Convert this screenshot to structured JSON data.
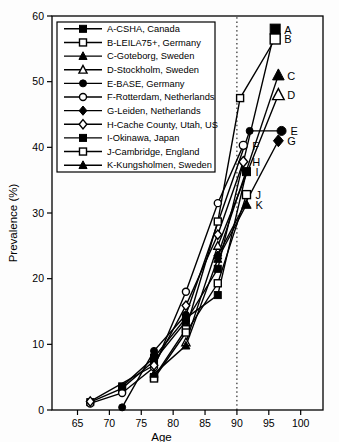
{
  "figure": {
    "x_axis_label": "Age",
    "y_axis_label": "Prevalence (%)",
    "ink_color": "#000000",
    "background_color": "#fdfdfd"
  },
  "chart_data": {
    "type": "line",
    "title": "",
    "xlabel": "Age",
    "ylabel": "Prevalence (%)",
    "xlim": [
      61,
      103.5
    ],
    "ylim": [
      0,
      60
    ],
    "x_ticks": [
      65,
      70,
      75,
      80,
      85,
      90,
      95,
      100
    ],
    "y_ticks": [
      0,
      10,
      20,
      30,
      40,
      50,
      60
    ],
    "grid": false,
    "reference_line": {
      "axis": "x",
      "value": 90,
      "style": "dotted"
    },
    "legend_position": "top-left-inside",
    "series": [
      {
        "key": "A",
        "label": "A-CSHA, Canada",
        "marker": "square",
        "fill": "filled",
        "end_label": "A",
        "end_marker_size": 10,
        "points": [
          [
            67,
            1.2
          ],
          [
            72,
            3.3
          ],
          [
            77,
            7.5
          ],
          [
            82,
            13.5
          ],
          [
            87,
            21.5
          ],
          [
            96,
            58
          ]
        ]
      },
      {
        "key": "B",
        "label": "B-LEILA75+, Germany",
        "marker": "square",
        "fill": "open",
        "end_label": "B",
        "end_marker_size": 10,
        "points": [
          [
            77,
            5.0
          ],
          [
            82,
            12.3
          ],
          [
            87,
            28.7
          ],
          [
            90.5,
            47.5
          ],
          [
            96,
            56.5
          ]
        ]
      },
      {
        "key": "C",
        "label": "C-Goteborg, Sweden",
        "marker": "triangle",
        "fill": "filled",
        "end_label": "C",
        "end_marker_size": 10,
        "points": [
          [
            87,
            23.5
          ],
          [
            96.5,
            51
          ]
        ]
      },
      {
        "key": "D",
        "label": "D-Stockholm, Sweden",
        "marker": "triangle",
        "fill": "open",
        "end_label": "D",
        "end_marker_size": 10,
        "points": [
          [
            82,
            10.3
          ],
          [
            87,
            25
          ],
          [
            96.5,
            48
          ]
        ]
      },
      {
        "key": "E",
        "label": "E-BASE, Germany",
        "marker": "circle",
        "fill": "filled",
        "end_label": "E",
        "end_marker_size": 9,
        "points": [
          [
            72,
            0.4
          ],
          [
            77,
            9
          ],
          [
            82,
            14.5
          ],
          [
            92,
            42.5
          ],
          [
            97,
            42.5
          ]
        ]
      },
      {
        "key": "F",
        "label": "F-Rotterdam, Netherlands",
        "marker": "circle",
        "fill": "open",
        "end_label": "F",
        "end_marker_size": 8,
        "points": [
          [
            67,
            1.0
          ],
          [
            72,
            2.6
          ],
          [
            77,
            6.5
          ],
          [
            82,
            18
          ],
          [
            87,
            31.5
          ],
          [
            91,
            40.3
          ]
        ]
      },
      {
        "key": "G",
        "label": "G-Leiden, Netherlands",
        "marker": "diamond",
        "fill": "filled",
        "end_label": "G",
        "end_marker_size": 9,
        "points": [
          [
            87,
            23.5
          ],
          [
            96.5,
            41
          ]
        ]
      },
      {
        "key": "H",
        "label": "H-Cache County, Utah, US",
        "marker": "diamond",
        "fill": "open",
        "end_label": "H",
        "end_marker_size": 8,
        "points": [
          [
            67,
            1.3
          ],
          [
            77,
            6.8
          ],
          [
            82,
            15.9
          ],
          [
            87,
            26.7
          ],
          [
            91,
            37.8
          ]
        ]
      },
      {
        "key": "I",
        "label": "I-Okinawa, Japan",
        "marker": "square",
        "fill": "filled",
        "end_label": "I",
        "end_marker_size": 8,
        "points": [
          [
            72,
            3.6
          ],
          [
            77,
            8
          ],
          [
            82,
            14
          ],
          [
            87,
            17.5
          ],
          [
            91.5,
            36.3
          ]
        ]
      },
      {
        "key": "J",
        "label": "J-Cambridge, England",
        "marker": "square",
        "fill": "open",
        "end_label": "J",
        "end_marker_size": 8,
        "points": [
          [
            77,
            4.8
          ],
          [
            82,
            11.8
          ],
          [
            87,
            19.3
          ],
          [
            91.5,
            32.8
          ]
        ]
      },
      {
        "key": "K",
        "label": "K-Kungsholmen, Sweden",
        "marker": "triangle",
        "fill": "filled",
        "end_label": "K",
        "end_marker_size": 8,
        "points": [
          [
            77,
            5.5
          ],
          [
            82,
            9.8
          ],
          [
            87,
            23
          ],
          [
            91.5,
            31.3
          ]
        ]
      }
    ]
  }
}
